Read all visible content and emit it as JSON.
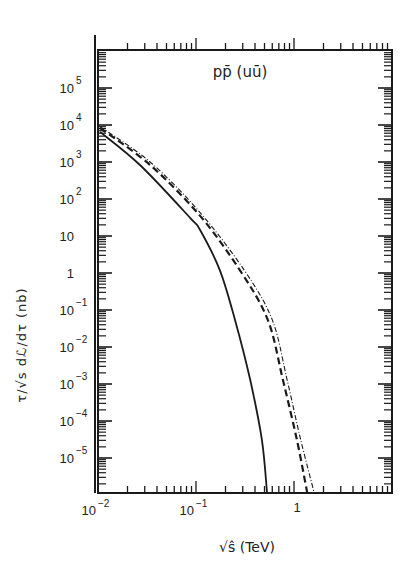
{
  "chart_data": {
    "type": "line",
    "title": "pp̄ (uū)",
    "xlabel": "√ŝ (TeV)",
    "ylabel": "τ/√s dℒ/dτ (nb)",
    "xscale": "log",
    "yscale": "log",
    "xlim": [
      0.01,
      10
    ],
    "ylim": [
      1.2e-06,
      1000000.0
    ],
    "grid": false,
    "legend": null,
    "x_tick_labels": [
      {
        "value": 0.01,
        "base": "10",
        "exp": "-2"
      },
      {
        "value": 0.1,
        "base": "10",
        "exp": "-1"
      },
      {
        "value": 1,
        "base": "1",
        "exp": ""
      }
    ],
    "y_tick_labels": [
      {
        "value": 100000.0,
        "base": "10",
        "exp": "5"
      },
      {
        "value": 10000.0,
        "base": "10",
        "exp": "4"
      },
      {
        "value": 1000.0,
        "base": "10",
        "exp": "3"
      },
      {
        "value": 100.0,
        "base": "10",
        "exp": "2"
      },
      {
        "value": 10,
        "base": "10",
        "exp": ""
      },
      {
        "value": 1,
        "base": "1",
        "exp": ""
      },
      {
        "value": 0.1,
        "base": "10",
        "exp": "-1"
      },
      {
        "value": 0.01,
        "base": "10",
        "exp": "-2"
      },
      {
        "value": 0.001,
        "base": "10",
        "exp": "-3"
      },
      {
        "value": 0.0001,
        "base": "10",
        "exp": "-4"
      },
      {
        "value": 1e-05,
        "base": "10",
        "exp": "-5"
      }
    ],
    "series": [
      {
        "name": "solid",
        "style": "solid",
        "x": [
          0.0105,
          0.0268,
          0.087,
          0.11,
          0.175,
          0.25,
          0.357,
          0.47,
          0.53
        ],
        "y": [
          6500,
          830,
          31,
          14.5,
          1.2,
          0.054,
          0.0013,
          3.1e-05,
          1.2e-06
        ]
      },
      {
        "name": "dashed",
        "style": "dashed",
        "x": [
          0.0105,
          0.034,
          0.11,
          0.28,
          0.54,
          0.77,
          1.07,
          1.36
        ],
        "y": [
          8300,
          830,
          35,
          1.2,
          0.054,
          0.0013,
          3.1e-05,
          1.2e-06
        ]
      },
      {
        "name": "dash-dot",
        "style": "dashdot",
        "x": [
          0.0105,
          0.034,
          0.11,
          0.31,
          0.6,
          0.85,
          1.17,
          1.6
        ],
        "y": [
          9000,
          1000,
          43,
          1.2,
          0.054,
          0.0013,
          3.1e-05,
          1.2e-06
        ]
      }
    ]
  },
  "labels": {
    "title": "pp̄ (uū)",
    "xlabel": "√ŝ (TeV)",
    "ylabel": "τ/√s dℒ/dτ (nb)"
  },
  "colors": {
    "ink": "#1a1a1a",
    "background": "#ffffff"
  }
}
